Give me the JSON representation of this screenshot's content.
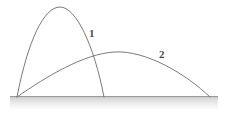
{
  "figure": {
    "background_color": "#ffffff",
    "width": 228,
    "height": 114
  },
  "ground": {
    "name": "ground-band",
    "top_line_color": "#9a9a9a",
    "gradient_from": "#bdbdbd",
    "gradient_to": "#ffffff",
    "x_start": 10,
    "x_end": 218,
    "y_top": 96,
    "y_bottom": 110,
    "baseline_y": 97
  },
  "labels": {
    "curve_1": "1",
    "curve_2": "2",
    "color": "#4a4a4a"
  },
  "chart_data": {
    "type": "line",
    "xlabel": "",
    "ylabel": "",
    "xlim": [
      0,
      228
    ],
    "ylim": [
      0,
      114
    ],
    "grid": false,
    "legend": "inline-labels",
    "annotations": [
      {
        "text": "1",
        "x": 91,
        "y": 33
      },
      {
        "text": "2",
        "x": 161,
        "y": 54
      }
    ],
    "intersection": {
      "x": 93,
      "y": 55
    },
    "series": [
      {
        "name": "1",
        "color": "#7a7a7a",
        "stroke_width": 1,
        "launch": {
          "x": 17,
          "y": 97
        },
        "apex": {
          "x": 60,
          "y": 7
        },
        "landing": {
          "x": 104,
          "y": 97
        },
        "range": 87,
        "max_height": 90,
        "path": "M 17 97 C 28 40, 44 7, 60 7 C 76 7, 94 45, 104 97"
      },
      {
        "name": "2",
        "color": "#7a7a7a",
        "stroke_width": 1,
        "launch": {
          "x": 17,
          "y": 97
        },
        "apex": {
          "x": 114,
          "y": 52
        },
        "landing": {
          "x": 210,
          "y": 97
        },
        "range": 193,
        "max_height": 45,
        "path": "M 17 97 C 47 76, 84 54, 114 52 C 146 50, 186 74, 210 97"
      }
    ]
  }
}
